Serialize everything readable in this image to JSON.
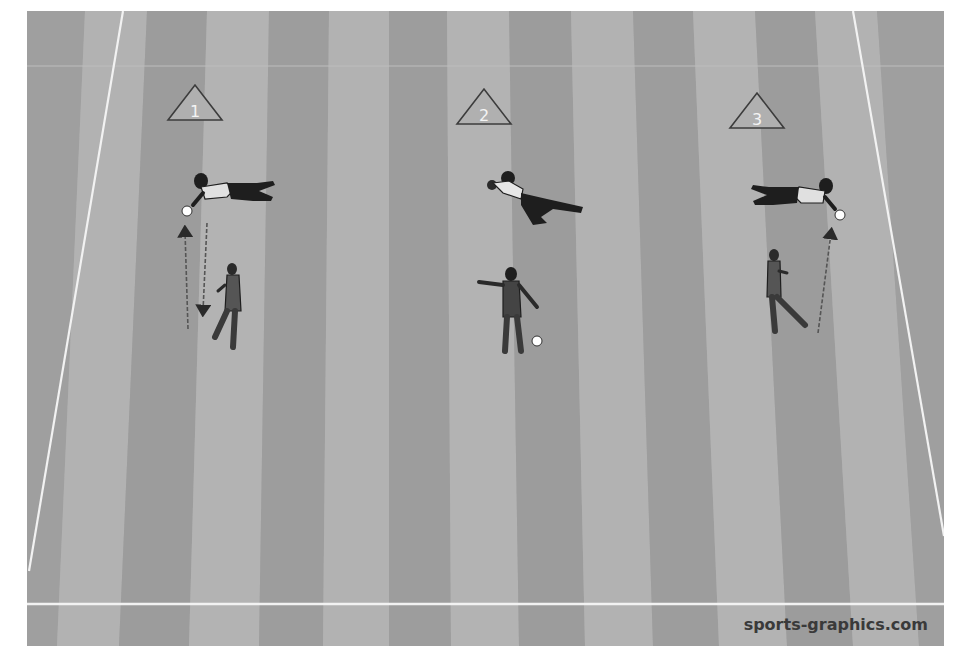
{
  "diagram": {
    "type": "sports-training-drill",
    "sport": "soccer",
    "colors": {
      "pitch_light": "#b4b4b4",
      "pitch_dark": "#9c9c9c",
      "lines": "#f2f2f2",
      "cone_fill": "#b0b0b0",
      "cone_stroke": "#3c3c3c",
      "players": "#1e1e1e"
    },
    "stations": [
      {
        "label": "1",
        "cone_x": 168,
        "cone_y": 98,
        "keeper_action": "diving save to the left, ball in hands",
        "server_action": "serves ball toward keeper",
        "arrows": [
          "up",
          "down"
        ]
      },
      {
        "label": "2",
        "cone_x": 457,
        "cone_y": 100,
        "keeper_action": "diving catch, ball held to chest",
        "server_action": "coach standing with ball at feet, pointing",
        "arrows": []
      },
      {
        "label": "3",
        "cone_x": 730,
        "cone_y": 105,
        "keeper_action": "diving save to the right, ball in hands",
        "server_action": "kicks ball toward keeper",
        "arrows": [
          "up"
        ]
      }
    ]
  },
  "watermark": "sports-graphics.com"
}
